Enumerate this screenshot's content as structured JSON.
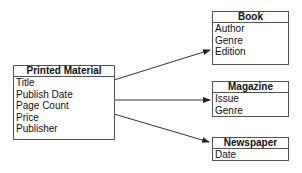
{
  "diagram": {
    "classes": [
      {
        "id": "printed",
        "name": "Printed Material",
        "attributes": [
          "Title",
          "Publish Date",
          "Page Count",
          "Price",
          "Publisher"
        ]
      },
      {
        "id": "book",
        "name": "Book",
        "attributes": [
          "Author",
          "Genre",
          "Edition"
        ]
      },
      {
        "id": "magazine",
        "name": "Magazine",
        "attributes": [
          "Issue",
          "Genre"
        ]
      },
      {
        "id": "newspaper",
        "name": "Newspaper",
        "attributes": [
          "Date"
        ]
      }
    ],
    "relations": [
      {
        "from": "Printed Material",
        "to": "Book"
      },
      {
        "from": "Printed Material",
        "to": "Magazine"
      },
      {
        "from": "Printed Material",
        "to": "Newspaper"
      }
    ],
    "colors": {
      "line": "#333333",
      "border": "#555555",
      "text": "#111111"
    }
  }
}
